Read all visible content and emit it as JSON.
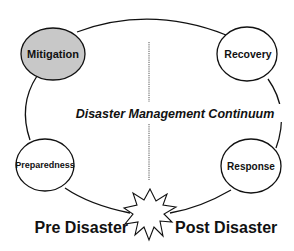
{
  "diagram": {
    "title": "Disaster Management Continuum",
    "nodes": [
      {
        "id": "mitigation",
        "label": "Mitigation",
        "fill": "#c8c8c8"
      },
      {
        "id": "recovery",
        "label": "Recovery",
        "fill": "#ffffff"
      },
      {
        "id": "preparedness",
        "label": "Preparedness",
        "fill": "#ffffff"
      },
      {
        "id": "response",
        "label": "Response",
        "fill": "#ffffff"
      }
    ],
    "phases": {
      "pre": "Pre Disaster",
      "post": "Post Disaster"
    },
    "colors": {
      "stroke": "#111111",
      "highlight": "#c8c8c8",
      "divider": "#555555"
    }
  }
}
